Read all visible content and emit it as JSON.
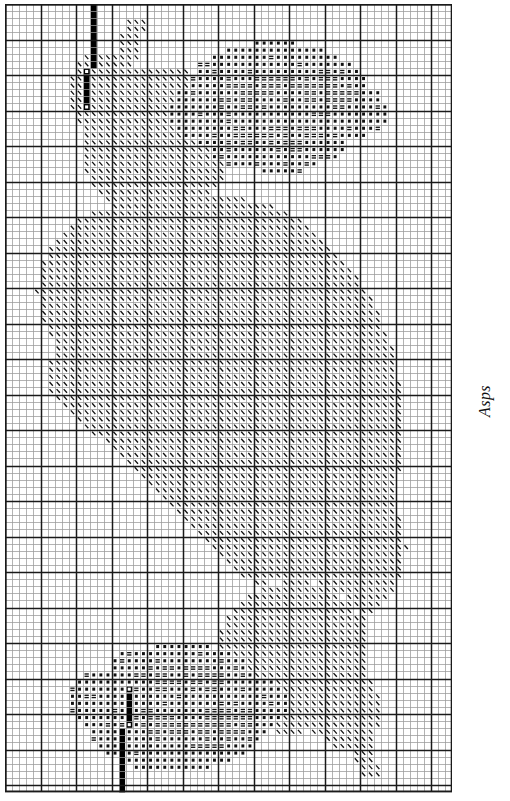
{
  "caption": {
    "text": "Asps"
  },
  "chart_data": {
    "type": "table",
    "title": "Asps",
    "subtitle": "",
    "xlabel": "",
    "ylabel": "",
    "grid": true,
    "legend_position": "none",
    "grid_cols": 63,
    "grid_rows": 111,
    "cell_px": 7.1,
    "bold_every": 5,
    "colors": {
      "page_background": "#ffffff",
      "light_rule": "#9a9a9a",
      "heavy_rule": "#1a1a1a",
      "symbol_ink": "#111111",
      "solid_fill": "#000000",
      "caption_ink": "#111111"
    },
    "symbols": [
      {
        "key": "dot",
        "glyph": "●",
        "name": "filled-dot",
        "meaning": "dark floss"
      },
      {
        "key": "bars",
        "glyph": "≡",
        "name": "double-bar",
        "meaning": "mid floss"
      },
      {
        "key": "slash",
        "glyph": "\\",
        "name": "backslash",
        "meaning": "light floss"
      },
      {
        "key": "solid",
        "glyph": "█",
        "name": "solid-black-cell",
        "meaning": "backstitch / border marker"
      },
      {
        "key": "open",
        "glyph": "□",
        "name": "open-square-cell",
        "meaning": "center marker"
      }
    ],
    "series": [
      {
        "name": "filled-dot",
        "count_estimate": 1120
      },
      {
        "name": "double-bar",
        "count_estimate": 640
      },
      {
        "name": "backslash",
        "count_estimate": 2310
      },
      {
        "name": "solid-black",
        "count_estimate": 44
      }
    ],
    "regions": [
      {
        "name": "top-flower-cluster",
        "symbols": [
          "dot",
          "bars"
        ],
        "bbox_cells": [
          14,
          2,
          62,
          27
        ]
      },
      {
        "name": "top-left-marker-bar",
        "symbols": [
          "solid",
          "open"
        ],
        "bbox_cells": [
          10,
          0,
          12,
          14
        ]
      },
      {
        "name": "top-leaf",
        "symbols": [
          "slash"
        ],
        "bbox_cells": [
          10,
          5,
          34,
          30
        ]
      },
      {
        "name": "central-body",
        "symbols": [
          "slash"
        ],
        "bbox_cells": [
          2,
          28,
          60,
          88
        ]
      },
      {
        "name": "bottom-leaf",
        "symbols": [
          "slash"
        ],
        "bbox_cells": [
          12,
          88,
          46,
          111
        ]
      },
      {
        "name": "bottom-marker-bar",
        "symbols": [
          "solid",
          "open"
        ],
        "bbox_cells": [
          11,
          97,
          18,
          111
        ]
      },
      {
        "name": "bottom-flower-cluster",
        "symbols": [
          "dot",
          "bars"
        ],
        "bbox_cells": [
          16,
          91,
          60,
          111
        ]
      }
    ]
  }
}
